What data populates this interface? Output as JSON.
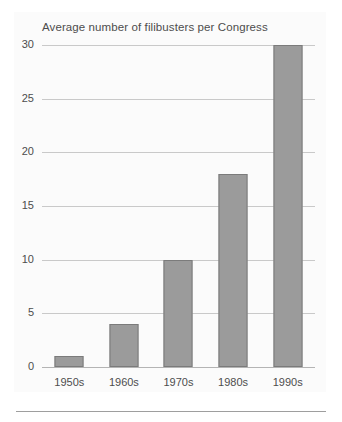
{
  "chart_data": {
    "type": "bar",
    "title": "Average number of filibusters per Congress",
    "xlabel": "",
    "ylabel": "",
    "categories": [
      "1950s",
      "1960s",
      "1970s",
      "1980s",
      "1990s"
    ],
    "values": [
      1,
      4,
      10,
      18,
      30
    ],
    "ylim": [
      0,
      30
    ],
    "yticks": [
      0,
      5,
      10,
      15,
      20,
      25,
      30
    ],
    "ytick_labels": [
      "0",
      "5",
      "10",
      "15",
      "20",
      "25",
      "30"
    ],
    "grid": true,
    "legend": false,
    "legend_position": "none",
    "series": [
      {
        "name": "Average number of filibusters per Congress",
        "values": [
          1,
          4,
          10,
          18,
          30
        ]
      }
    ],
    "colors": {
      "bar_fill": "#9b9b9b",
      "bar_border": "#7b7b7b",
      "gridline": "#c9c9c9",
      "axis": "#b4b4b4",
      "text": "#4d4d4d",
      "panel_background": "#fbfbfb",
      "figure_background": "#ffffff"
    }
  }
}
